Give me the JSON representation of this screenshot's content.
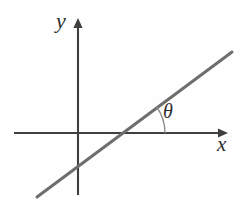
{
  "figure": {
    "background_color": "#fefefe"
  },
  "labels": {
    "y_axis": "y",
    "x_axis": "x",
    "angle": "θ"
  },
  "colors": {
    "axis": "#3f3f3f",
    "line": "#6e6e6e",
    "arc": "#8a8a8a",
    "label": "#2e2e2e"
  },
  "chart_data": {
    "type": "line",
    "title": "",
    "xlabel": "x",
    "ylabel": "y",
    "grid": false,
    "legend": "none",
    "annotations": [
      {
        "name": "angle-theta",
        "text": "θ",
        "description": "Angle between the drawn line and the positive x-axis, marked with an arc",
        "vertex_px": [
          120,
          133
        ],
        "arc_radius_px": 45,
        "arc_start_deg": 0,
        "arc_end_deg": 36
      }
    ],
    "axes": {
      "x_axis": {
        "start_px": [
          14,
          133
        ],
        "end_px": [
          228,
          133
        ],
        "arrow": "right",
        "label": "x"
      },
      "y_axis": {
        "start_px": [
          78,
          195
        ],
        "end_px": [
          78,
          18
        ],
        "arrow": "up",
        "label": "y"
      },
      "origin_px": [
        78,
        133
      ]
    },
    "series": [
      {
        "name": "line",
        "points_px": [
          [
            37,
            197
          ],
          [
            232,
            52
          ]
        ],
        "x_intercept_px": [
          120,
          133
        ],
        "y_intercept_px": [
          78,
          164
        ],
        "slope_deg": 36.6
      }
    ]
  }
}
